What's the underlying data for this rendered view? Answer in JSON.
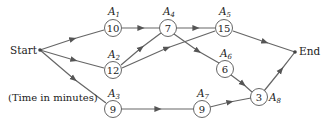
{
  "diagram": {
    "type": "activity-network",
    "start_label": "Start",
    "end_label": "End",
    "note": "(Time in minutes)",
    "nodes": [
      {
        "id": "A1",
        "name": "A",
        "sub": "1",
        "value": "10"
      },
      {
        "id": "A2",
        "name": "A",
        "sub": "2",
        "value": "12"
      },
      {
        "id": "A3",
        "name": "A",
        "sub": "3",
        "value": "9"
      },
      {
        "id": "A4",
        "name": "A",
        "sub": "4",
        "value": "7"
      },
      {
        "id": "A5",
        "name": "A",
        "sub": "5",
        "value": "15"
      },
      {
        "id": "A6",
        "name": "A",
        "sub": "6",
        "value": "6"
      },
      {
        "id": "A7",
        "name": "A",
        "sub": "7",
        "value": "9"
      },
      {
        "id": "A8",
        "name": "A",
        "sub": "8",
        "value": "3"
      }
    ],
    "edges": [
      [
        "Start",
        "A1"
      ],
      [
        "Start",
        "A2"
      ],
      [
        "Start",
        "A3"
      ],
      [
        "A1",
        "A4"
      ],
      [
        "A2",
        "A4"
      ],
      [
        "A2",
        "A5"
      ],
      [
        "A4",
        "A5"
      ],
      [
        "A4",
        "A6"
      ],
      [
        "A5",
        "End"
      ],
      [
        "A6",
        "A8"
      ],
      [
        "A3",
        "A7"
      ],
      [
        "A7",
        "A8"
      ],
      [
        "A8",
        "End"
      ]
    ]
  }
}
